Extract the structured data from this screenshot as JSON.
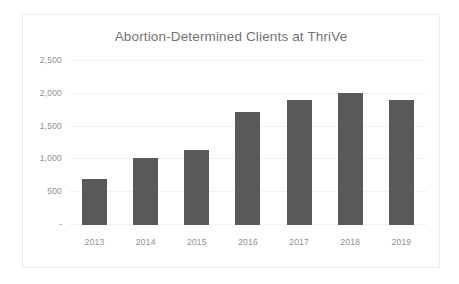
{
  "chart_data": {
    "type": "bar",
    "title": "Abortion-Determined Clients at ThriVe",
    "xlabel": "",
    "ylabel": "",
    "categories": [
      "2013",
      "2014",
      "2015",
      "2016",
      "2017",
      "2018",
      "2019"
    ],
    "values": [
      700,
      1020,
      1150,
      1720,
      1910,
      2005,
      1910
    ],
    "ylim": [
      0,
      2500
    ],
    "yticks": [
      0,
      500,
      1000,
      1500,
      2000,
      2500
    ],
    "ytick_labels": [
      "-",
      "500",
      "1,000",
      "1,500",
      "2,000",
      "2,500"
    ],
    "grid": true,
    "legend": "none",
    "series": [
      {
        "name": "Abortion-Determined Clients",
        "values": [
          700,
          1020,
          1150,
          1720,
          1910,
          2005,
          1910
        ]
      }
    ],
    "colors": {
      "bar": "#595959",
      "gridline": "#f3f3f3",
      "tick_label": "#8f8f8f",
      "title": "#737373",
      "plot_background": "#ffffff",
      "border": "#ededed"
    }
  }
}
